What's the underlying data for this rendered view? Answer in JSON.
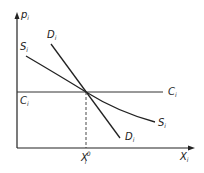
{
  "diagram": {
    "type": "supply-demand",
    "axes": {
      "y_label": "p",
      "y_label_sub": "i",
      "x_label": "X",
      "x_label_sub": "i"
    },
    "curves": {
      "supply": {
        "label": "S",
        "sub": "i"
      },
      "demand": {
        "label": "D",
        "sub": "i"
      },
      "cost": {
        "label": "C",
        "sub": "i"
      }
    },
    "equilibrium": {
      "x_label": "X",
      "x_label_sub": "i",
      "x_label_sup": "0",
      "y_label": "C",
      "y_label_sub": "i"
    },
    "colors": {
      "line": "#222222",
      "background": "#ffffff"
    }
  }
}
